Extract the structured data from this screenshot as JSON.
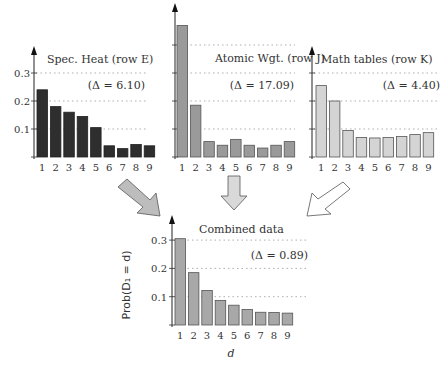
{
  "chart_data": [
    {
      "type": "bar",
      "title": "Spec. Heat (row E)",
      "annotation": "(Δ = 6.10)",
      "categories": [
        "1",
        "2",
        "3",
        "4",
        "5",
        "6",
        "7",
        "8",
        "9"
      ],
      "values": [
        0.24,
        0.18,
        0.16,
        0.145,
        0.105,
        0.04,
        0.03,
        0.045,
        0.04
      ],
      "xlabel": "",
      "ylabel": "",
      "ylim": [
        0,
        0.35
      ],
      "yticks": [
        "0.1",
        "0.2",
        "0.3"
      ],
      "grid": "dotted horizontal",
      "bar_color": "#2e2e2e"
    },
    {
      "type": "bar",
      "title": "Atomic Wgt. (row J)",
      "annotation": "(Δ = 17.09)",
      "categories": [
        "1",
        "2",
        "3",
        "4",
        "5",
        "6",
        "7",
        "8",
        "9"
      ],
      "values": [
        0.47,
        0.185,
        0.055,
        0.042,
        0.063,
        0.042,
        0.032,
        0.042,
        0.055
      ],
      "xlabel": "",
      "ylabel": "",
      "ylim": [
        0,
        0.5
      ],
      "yticks": [],
      "grid": "dotted horizontal",
      "bar_color": "#9a9a9a"
    },
    {
      "type": "bar",
      "title": "Math tables (row K)",
      "annotation": "(Δ = 4.40)",
      "categories": [
        "1",
        "2",
        "3",
        "4",
        "5",
        "6",
        "7",
        "8",
        "9"
      ],
      "values": [
        0.255,
        0.2,
        0.095,
        0.07,
        0.068,
        0.07,
        0.073,
        0.08,
        0.087
      ],
      "xlabel": "",
      "ylabel": "",
      "ylim": [
        0,
        0.35
      ],
      "yticks": [],
      "grid": "dotted horizontal",
      "bar_color": "#d4d4d4"
    },
    {
      "type": "bar",
      "title": "Combined data",
      "annotation": "(Δ = 0.89)",
      "categories": [
        "1",
        "2",
        "3",
        "4",
        "5",
        "6",
        "7",
        "8",
        "9"
      ],
      "values": [
        0.305,
        0.185,
        0.122,
        0.087,
        0.07,
        0.055,
        0.045,
        0.044,
        0.042
      ],
      "xlabel": "d",
      "ylabel": "Prob(D₁ = d)",
      "ylim": [
        0,
        0.35
      ],
      "yticks": [
        "0.1",
        "0.2",
        "0.3"
      ],
      "grid": "dotted horizontal",
      "bar_color": "#a8a8a8"
    }
  ],
  "arrows": [
    {
      "from": "Spec. Heat (row E)",
      "to": "Combined data",
      "fill": "#bdbdbd"
    },
    {
      "from": "Atomic Wgt. (row J)",
      "to": "Combined data",
      "fill": "#d9d9d9"
    },
    {
      "from": "Math tables (row K)",
      "to": "Combined data",
      "fill": "#ffffff"
    }
  ]
}
